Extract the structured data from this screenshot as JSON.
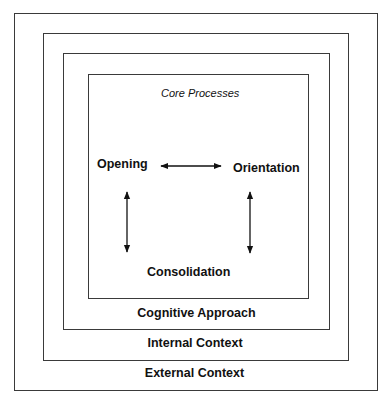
{
  "diagram": {
    "layers": [
      {
        "name": "external",
        "label": "External Context"
      },
      {
        "name": "internal",
        "label": "Internal Context"
      },
      {
        "name": "cognitive",
        "label": "Cognitive Approach"
      },
      {
        "name": "core",
        "label": "Core Processes"
      }
    ],
    "nodes": {
      "opening": "Opening",
      "orientation": "Orientation",
      "consolidation": "Consolidation"
    },
    "connections": [
      {
        "from": "Opening",
        "to": "Orientation",
        "type": "bidirectional"
      },
      {
        "from": "Opening",
        "to": "Consolidation",
        "type": "bidirectional"
      },
      {
        "from": "Orientation",
        "to": "Consolidation",
        "type": "bidirectional"
      }
    ],
    "colors": {
      "line": "#3a3a3a",
      "text": "#111111",
      "background": "#ffffff"
    }
  }
}
